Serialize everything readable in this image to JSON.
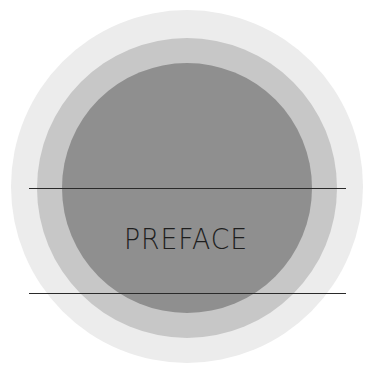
{
  "title": "PREFACE",
  "colors": {
    "outer_ring": "#ececec",
    "middle_ring": "#c7c7c7",
    "inner_circle": "#8f8f8f",
    "rule_lines": "#2a2a2a",
    "text": "#1e1e1e"
  }
}
